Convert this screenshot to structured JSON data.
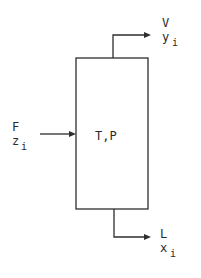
{
  "diagram": {
    "type": "flash-drum-schematic",
    "vessel": {
      "label": "T,P"
    },
    "streams": {
      "feed": {
        "name": "F",
        "composition_symbol": "z",
        "composition_subscript": "i",
        "direction": "in"
      },
      "vapor": {
        "name": "V",
        "composition_symbol": "y",
        "composition_subscript": "i",
        "direction": "out-top"
      },
      "liquid": {
        "name": "L",
        "composition_symbol": "x",
        "composition_subscript": "i",
        "direction": "out-bottom"
      }
    },
    "colors": {
      "line": "#2e2e2e",
      "text": "#2a2a2a",
      "background": "#ffffff"
    }
  }
}
